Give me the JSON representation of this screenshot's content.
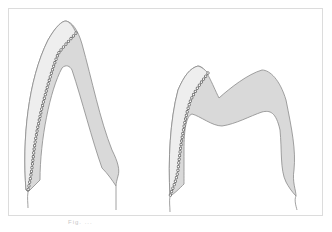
{
  "figure": {
    "colors": {
      "background": "#ffffff",
      "frame": "#dcdcdc",
      "core_fill": "#d9d9d9",
      "veneer_fill": "#eeeeee",
      "outline": "#8a8a8a",
      "beads": "#6e6e6e"
    },
    "panels": [
      {
        "id": "left",
        "label": "anterior single-cusp section"
      },
      {
        "id": "right",
        "label": "posterior two-cusp section"
      }
    ]
  },
  "caption": {
    "text": "Fig. ..."
  }
}
